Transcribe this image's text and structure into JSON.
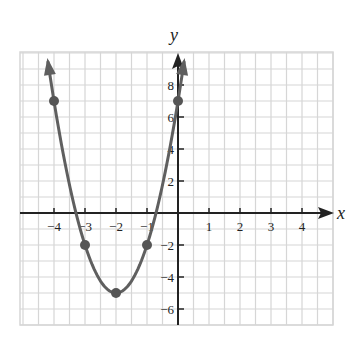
{
  "chart_data": {
    "type": "line",
    "title": "",
    "xlabel": "x",
    "ylabel": "y",
    "xlim": [
      -5,
      5
    ],
    "ylim": [
      -7,
      10
    ],
    "grid": true,
    "x_ticks": [
      -4,
      -3,
      -2,
      -1,
      1,
      2,
      3,
      4
    ],
    "x_tick_labels": [
      "−4",
      "−3",
      "−2",
      "−1",
      "1",
      "2",
      "3",
      "4"
    ],
    "y_ticks": [
      8,
      6,
      4,
      2,
      -2,
      -4,
      -6
    ],
    "y_tick_labels": [
      "8",
      "6",
      "4",
      "2",
      "−2",
      "−4",
      "−6"
    ],
    "function": "y = 3x^2 + 12x + 7",
    "series": [
      {
        "name": "parabola",
        "x": [
          -4,
          -3,
          -2,
          -1,
          0
        ],
        "y": [
          7,
          -2,
          -5,
          -2,
          7
        ],
        "marked_points": true,
        "color": "#5f5f5f"
      }
    ],
    "legend": null
  },
  "colors": {
    "grid": "#d6d6d6",
    "axis": "#222222",
    "curve": "#606060",
    "point": "#555555"
  }
}
